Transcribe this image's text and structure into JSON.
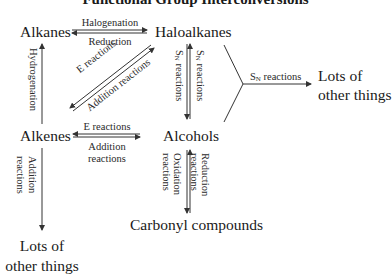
{
  "title": "Functional Group Interconversions",
  "nodes": {
    "alkanes": "Alkanes",
    "haloalkanes": "Haloalkanes",
    "alkenes": "Alkenes",
    "alcohols": "Alcohols",
    "carbonyl": "Carbonyl compounds",
    "lots_right_1": "Lots of",
    "lots_right_2": "other things",
    "lots_bottom_1": "Lots of",
    "lots_bottom_2": "other things"
  },
  "reactions": {
    "halogenation": "Halogenation",
    "reduction": "Reduction",
    "hydrogenation": "Hydrogenation",
    "diag_e": "E reactions",
    "diag_addition": "Addition reactions",
    "sn_left_s": "S",
    "sn_left_n": "N",
    "sn_left_rest": " reactions",
    "sn_right_s": "S",
    "sn_right_n": "N",
    "sn_right_rest": " reactions",
    "sn_branch_s": "S",
    "sn_branch_n": "N",
    "sn_branch_rest": " reactions",
    "h_e": "E reactions",
    "h_addition_1": "Addition",
    "h_addition_2": "reactions",
    "down_addition_1": "Addition",
    "down_addition_2": "reactions",
    "oxidation_1": "Oxidation",
    "oxidation_2": "reactions",
    "reduction2_1": "Reduction",
    "reduction2_2": "reactions"
  },
  "colors": {
    "line": "#333333",
    "text": "#1a1a1a"
  }
}
